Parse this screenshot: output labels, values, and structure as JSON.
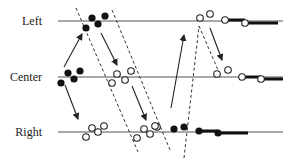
{
  "labels": {
    "left": "Left",
    "center": "Center",
    "right": "Right"
  },
  "colors": {
    "line": "#555555",
    "dot_filled": "#111111",
    "dot_open_stroke": "#222222",
    "dot_open_fill": "#ffffff",
    "arrow": "#222222",
    "dashed": "#333333",
    "label": "#222222"
  },
  "rows": [
    {
      "id": "left",
      "y": 21,
      "x1": 58,
      "x2": 283,
      "label_x": 42
    },
    {
      "id": "center",
      "y": 77,
      "x1": 58,
      "x2": 283,
      "label_x": 42
    },
    {
      "id": "right",
      "y": 132,
      "x1": 58,
      "x2": 283,
      "label_x": 42
    }
  ],
  "filled_dots": [
    {
      "x": 92,
      "y": 18
    },
    {
      "x": 105,
      "y": 16
    },
    {
      "x": 86,
      "y": 28
    },
    {
      "x": 98,
      "y": 24
    },
    {
      "x": 68,
      "y": 73
    },
    {
      "x": 80,
      "y": 71
    },
    {
      "x": 74,
      "y": 79
    },
    {
      "x": 61,
      "y": 83
    },
    {
      "x": 174,
      "y": 129
    },
    {
      "x": 184,
      "y": 127
    },
    {
      "x": 199,
      "y": 131
    },
    {
      "x": 218,
      "y": 133
    }
  ],
  "open_dots": [
    {
      "x": 200,
      "y": 18
    },
    {
      "x": 210,
      "y": 14
    },
    {
      "x": 225,
      "y": 20
    },
    {
      "x": 245,
      "y": 23
    },
    {
      "x": 117,
      "y": 74
    },
    {
      "x": 131,
      "y": 71
    },
    {
      "x": 112,
      "y": 83
    },
    {
      "x": 125,
      "y": 80
    },
    {
      "x": 217,
      "y": 74
    },
    {
      "x": 228,
      "y": 70
    },
    {
      "x": 242,
      "y": 77
    },
    {
      "x": 261,
      "y": 79
    },
    {
      "x": 92,
      "y": 128
    },
    {
      "x": 104,
      "y": 126
    },
    {
      "x": 86,
      "y": 137
    },
    {
      "x": 98,
      "y": 132
    },
    {
      "x": 144,
      "y": 129
    },
    {
      "x": 157,
      "y": 127
    },
    {
      "x": 137,
      "y": 138
    },
    {
      "x": 150,
      "y": 134
    },
    {
      "x": 155,
      "y": 126
    }
  ],
  "thick_segments": [
    {
      "x1": 225,
      "y1": 20,
      "x2": 245,
      "y2": 20
    },
    {
      "x1": 245,
      "y1": 23,
      "x2": 278,
      "y2": 23
    },
    {
      "x1": 242,
      "y1": 77,
      "x2": 261,
      "y2": 77
    },
    {
      "x1": 261,
      "y1": 79,
      "x2": 283,
      "y2": 79
    },
    {
      "x1": 199,
      "y1": 131,
      "x2": 218,
      "y2": 131
    },
    {
      "x1": 218,
      "y1": 133,
      "x2": 248,
      "y2": 133
    }
  ],
  "arrows": [
    {
      "x1": 64,
      "y1": 67,
      "x2": 82,
      "y2": 34
    },
    {
      "x1": 101,
      "y1": 33,
      "x2": 117,
      "y2": 65
    },
    {
      "x1": 65,
      "y1": 85,
      "x2": 78,
      "y2": 119
    },
    {
      "x1": 132,
      "y1": 86,
      "x2": 146,
      "y2": 120
    },
    {
      "x1": 171,
      "y1": 108,
      "x2": 184,
      "y2": 35
    },
    {
      "x1": 210,
      "y1": 28,
      "x2": 222,
      "y2": 60
    }
  ],
  "dashed_lines": [
    {
      "x1": 76,
      "y1": 8,
      "x2": 138,
      "y2": 152
    },
    {
      "x1": 112,
      "y1": 10,
      "x2": 170,
      "y2": 150
    },
    {
      "x1": 184,
      "y1": 158,
      "x2": 199,
      "y2": 26
    },
    {
      "x1": 199,
      "y1": 26,
      "x2": 218,
      "y2": 70
    }
  ]
}
